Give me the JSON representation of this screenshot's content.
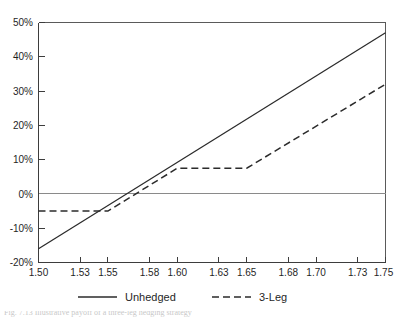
{
  "chart_data": {
    "type": "line",
    "title": "",
    "xlabel": "",
    "ylabel": "",
    "xlim": [
      1.5,
      1.75
    ],
    "ylim": [
      -0.2,
      0.5
    ],
    "grid": false,
    "zero_line": true,
    "legend_position": "below-axis",
    "x_tick_labels": [
      "1.50",
      "1.53",
      "1.55",
      "1.58",
      "1.60",
      "1.63",
      "1.65",
      "1.68",
      "1.70",
      "1.73",
      "1.75"
    ],
    "x_tick_values": [
      1.5,
      1.53,
      1.55,
      1.58,
      1.6,
      1.63,
      1.65,
      1.68,
      1.7,
      1.73,
      1.75
    ],
    "y_tick_labels": [
      "-20%",
      "-10%",
      "0%",
      "10%",
      "20%",
      "30%",
      "40%",
      "50%"
    ],
    "y_tick_values": [
      -0.2,
      -0.1,
      0.0,
      0.1,
      0.2,
      0.3,
      0.4,
      0.5
    ],
    "series": [
      {
        "name": "Unhedged",
        "style": "solid",
        "color": "#2b2b2b",
        "x": [
          1.5,
          1.75
        ],
        "values": [
          -0.16,
          0.47
        ]
      },
      {
        "name": "3-Leg",
        "style": "dashed",
        "color": "#2b2b2b",
        "x": [
          1.5,
          1.55,
          1.6,
          1.65,
          1.75
        ],
        "values": [
          -0.05,
          -0.05,
          0.075,
          0.075,
          0.32
        ]
      }
    ]
  },
  "legend": {
    "items": [
      {
        "label": "Unhedged",
        "style": "solid"
      },
      {
        "label": "3-Leg",
        "style": "dashed"
      }
    ]
  },
  "caption": {
    "text": "Fig. 7.13  Illustrative payoff of a three-leg hedging strategy"
  }
}
